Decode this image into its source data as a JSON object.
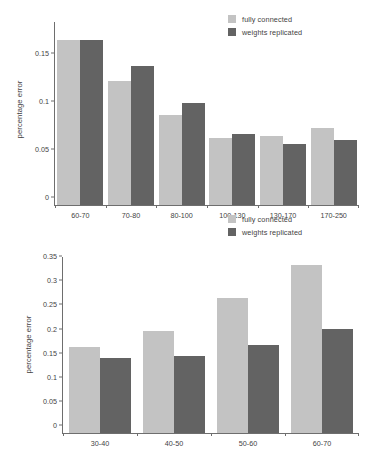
{
  "colors": {
    "fully_connected": "#c3c3c3",
    "weights_replicated": "#636363",
    "axis": "#6e6e6e",
    "text": "#3f3f3f",
    "background": "#ffffff"
  },
  "legend": {
    "series1_label": "fully connected",
    "series2_label": "weights replicated"
  },
  "chart_data": [
    {
      "type": "bar",
      "title": "",
      "xlabel": "",
      "ylabel": "percentage error",
      "ylim": [
        0,
        0.19
      ],
      "yticks": [
        "0",
        "0.05",
        "0.1",
        "0.15"
      ],
      "ytick_values": [
        0,
        0.05,
        0.1,
        0.15
      ],
      "grid": false,
      "legend_position": "top-right",
      "categories": [
        "60-70",
        "70-80",
        "80-100",
        "100-130",
        "130-170",
        "170-250"
      ],
      "series": [
        {
          "name": "fully connected",
          "values": [
            0.171,
            0.129,
            0.093,
            0.07,
            0.072,
            0.08
          ]
        },
        {
          "name": "weights replicated",
          "values": [
            0.171,
            0.144,
            0.106,
            0.074,
            0.063,
            0.068
          ]
        }
      ]
    },
    {
      "type": "bar",
      "title": "",
      "xlabel": "",
      "ylabel": "percentage error",
      "ylim": [
        0,
        0.365
      ],
      "yticks": [
        "0",
        "0.05",
        "0.1",
        "0.15",
        "0.2",
        "0.25",
        "0.3",
        "0.35"
      ],
      "ytick_values": [
        0,
        0.05,
        0.1,
        0.15,
        0.2,
        0.25,
        0.3,
        0.35
      ],
      "grid": false,
      "legend_position": "top-right",
      "categories": [
        "30-40",
        "40-50",
        "50-60",
        "60-70"
      ],
      "series": [
        {
          "name": "fully connected",
          "values": [
            0.178,
            0.212,
            0.28,
            0.349
          ]
        },
        {
          "name": "weights replicated",
          "values": [
            0.155,
            0.159,
            0.182,
            0.216
          ]
        }
      ]
    }
  ]
}
